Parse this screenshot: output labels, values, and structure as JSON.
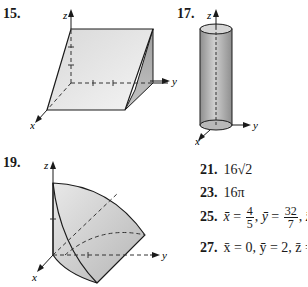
{
  "figures": [
    {
      "number": "15.",
      "description": "wedge solid (prism) in first octant",
      "axes": [
        "x",
        "y",
        "z"
      ]
    },
    {
      "number": "17.",
      "description": "vertical cylinder along z-axis",
      "axes": [
        "x",
        "y",
        "z"
      ]
    },
    {
      "number": "19.",
      "description": "curved solid bounded by parabolic surfaces",
      "axes": [
        "x",
        "y",
        "z"
      ]
    }
  ],
  "answers": [
    {
      "number": "21.",
      "text": "16√2"
    },
    {
      "number": "23.",
      "text": "16π"
    },
    {
      "number": "25.",
      "xbar": "x̄",
      "x_num": "4",
      "x_den": "5",
      "ybar": "ȳ",
      "y_num": "32",
      "y_den": "7",
      "zbar": "z̄",
      "z_num": "8",
      "z_den": "3"
    },
    {
      "number": "27.",
      "text": "x̄ = 0, ȳ = 2, z̄ = 0"
    }
  ],
  "labels": {
    "x": "x",
    "y": "y",
    "z": "z"
  },
  "colors": {
    "shade_light": "#e6e6e6",
    "shade_dark": "#a8a8a8",
    "line": "#1a1a1a"
  }
}
